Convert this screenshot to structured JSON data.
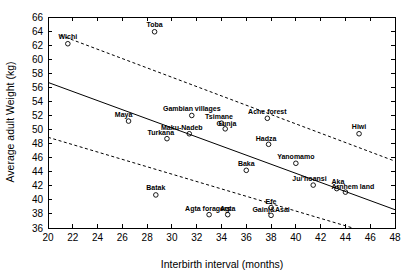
{
  "chart_data": {
    "type": "scatter",
    "title": "",
    "xlabel": "Interbirth interval (months)",
    "ylabel": "Average adult Weight (kg)",
    "xlim": [
      20,
      48
    ],
    "ylim": [
      36,
      66
    ],
    "xticks": [
      20,
      22,
      24,
      26,
      28,
      30,
      32,
      34,
      36,
      38,
      40,
      42,
      44,
      46,
      48
    ],
    "yticks": [
      36,
      38,
      40,
      42,
      44,
      46,
      48,
      50,
      52,
      54,
      56,
      58,
      60,
      62,
      64,
      66
    ],
    "grid": false,
    "legend": "none",
    "marker": "open-circle",
    "points": [
      {
        "label": "Toba",
        "x": 28.6,
        "y": 63.9,
        "label_dx": 0,
        "label_dy": -4.5,
        "anchor": "middle"
      },
      {
        "label": "Wichi",
        "x": 21.6,
        "y": 62.2,
        "label_dx": 0,
        "label_dy": -4.5,
        "anchor": "middle"
      },
      {
        "label": "Gambian villages",
        "x": 31.6,
        "y": 52.0,
        "label_dx": 0,
        "label_dy": -4.5,
        "anchor": "middle"
      },
      {
        "label": "Ache forest",
        "x": 37.7,
        "y": 51.6,
        "label_dx": 0,
        "label_dy": -4.5,
        "anchor": "middle"
      },
      {
        "label": "Maya",
        "x": 26.5,
        "y": 51.2,
        "label_dx": -0.4,
        "label_dy": -4.5,
        "anchor": "middle"
      },
      {
        "label": "Tsimane",
        "x": 34.0,
        "y": 50.9,
        "label_dx": -0.2,
        "label_dy": -4.2,
        "anchor": "middle"
      },
      {
        "label": "Gunja",
        "x": 34.3,
        "y": 50.1,
        "label_dx": 0.1,
        "label_dy": -3.2,
        "anchor": "middle"
      },
      {
        "label": "Hiwi",
        "x": 45.1,
        "y": 49.4,
        "label_dx": 0,
        "label_dy": -4.5,
        "anchor": "middle"
      },
      {
        "label": "Maku-Nadeb",
        "x": 31.4,
        "y": 49.4,
        "label_dx": -0.6,
        "label_dy": -3.6,
        "anchor": "middle"
      },
      {
        "label": "Turkana",
        "x": 29.6,
        "y": 48.7,
        "label_dx": -0.5,
        "label_dy": -3.6,
        "anchor": "middle"
      },
      {
        "label": "Hadza",
        "x": 37.8,
        "y": 47.9,
        "label_dx": -0.2,
        "label_dy": -3.6,
        "anchor": "middle"
      },
      {
        "label": "Yanomamo",
        "x": 40.0,
        "y": 45.2,
        "label_dx": 0,
        "label_dy": -4.5,
        "anchor": "middle"
      },
      {
        "label": "Baka",
        "x": 36.0,
        "y": 44.2,
        "label_dx": 0,
        "label_dy": -4.5,
        "anchor": "middle"
      },
      {
        "label": "Ju/'hoansi",
        "x": 41.4,
        "y": 42.1,
        "label_dx": -0.3,
        "label_dy": -4.2,
        "anchor": "middle"
      },
      {
        "label": "Aka",
        "x": 43.3,
        "y": 41.6,
        "label_dx": 0.1,
        "label_dy": -4.2,
        "anchor": "middle"
      },
      {
        "label": "Arnhem land",
        "x": 44.0,
        "y": 41.1,
        "label_dx": 0.6,
        "label_dy": -3.2,
        "anchor": "middle"
      },
      {
        "label": "Batak",
        "x": 28.7,
        "y": 40.7,
        "label_dx": 0,
        "label_dy": -4.5,
        "anchor": "middle"
      },
      {
        "label": "Efe",
        "x": 38.0,
        "y": 38.9,
        "label_dx": 0,
        "label_dy": -4.0,
        "anchor": "middle"
      },
      {
        "label": "Agta foragers",
        "x": 33.0,
        "y": 37.9,
        "label_dx": -0.1,
        "label_dy": -3.6,
        "anchor": "middle"
      },
      {
        "label": "Agta",
        "x": 34.5,
        "y": 37.9,
        "label_dx": 0.0,
        "label_dy": -3.6,
        "anchor": "middle"
      },
      {
        "label": "Gainj&Asai",
        "x": 38.0,
        "y": 37.8,
        "label_dx": 0.0,
        "label_dy": -3.6,
        "anchor": "middle"
      }
    ],
    "series": [
      {
        "name": "regression-fit",
        "style": "solid",
        "x": [
          20,
          48
        ],
        "y": [
          56.7,
          38.6
        ]
      },
      {
        "name": "upper-confidence-band",
        "style": "dashed",
        "x": [
          21.0,
          48
        ],
        "y": [
          63.4,
          45.5
        ]
      },
      {
        "name": "lower-confidence-band",
        "style": "dashed",
        "x": [
          20,
          44.6
        ],
        "y": [
          48.9,
          36.0
        ]
      }
    ]
  }
}
